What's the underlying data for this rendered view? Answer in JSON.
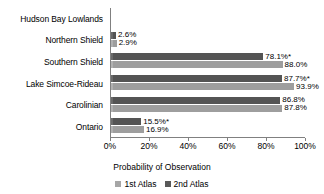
{
  "chart_data": {
    "type": "bar",
    "orientation": "horizontal",
    "title": "",
    "xlabel": "Probability of Observation",
    "ylabel": "",
    "xlim": [
      0,
      100
    ],
    "xticks": [
      "0%",
      "20%",
      "40%",
      "60%",
      "80%",
      "100%"
    ],
    "xtick_values": [
      0,
      20,
      40,
      60,
      80,
      100
    ],
    "grid": false,
    "legend_position": "bottom",
    "categories": [
      "Hudson Bay Lowlands",
      "Northern Shield",
      "Southern Shield",
      "Lake Simcoe-Rideau",
      "Carolinian",
      "Ontario"
    ],
    "series": [
      {
        "name": "1st Atlas",
        "color": "#a6a6a6",
        "values": [
          0,
          2.9,
          88.0,
          93.9,
          87.8,
          16.9
        ],
        "labels": [
          "",
          "2.9%",
          "88.0%",
          "93.9%",
          "87.8%",
          "16.9%"
        ]
      },
      {
        "name": "2nd Atlas",
        "color": "#595959",
        "values": [
          0,
          2.6,
          78.1,
          87.7,
          86.8,
          15.5
        ],
        "labels": [
          "",
          "2.6%",
          "78.1%*",
          "87.7%*",
          "86.8%",
          "15.5%*"
        ]
      }
    ]
  }
}
